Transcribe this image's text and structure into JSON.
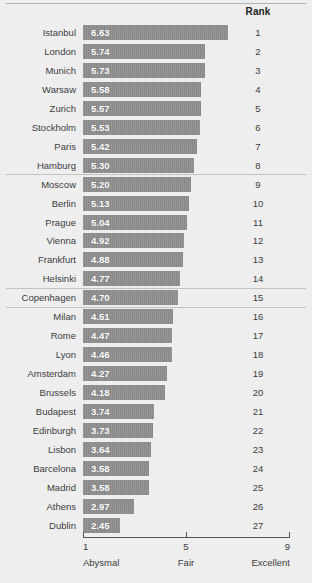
{
  "chart_data": {
    "type": "bar",
    "title": "",
    "subtitle": "",
    "orientation": "horizontal",
    "xlabel": "",
    "ylabel": "",
    "xlim": [
      1,
      9
    ],
    "grid": false,
    "legend": null,
    "categories": [
      "Istanbul",
      "London",
      "Munich",
      "Warsaw",
      "Zurich",
      "Stockholm",
      "Paris",
      "Hamburg",
      "Moscow",
      "Berlin",
      "Prague",
      "Vienna",
      "Frankfurt",
      "Helsinki",
      "Copenhagen",
      "Milan",
      "Rome",
      "Lyon",
      "Amsterdam",
      "Brussels",
      "Budapest",
      "Edinburgh",
      "Lisbon",
      "Barcelona",
      "Madrid",
      "Athens",
      "Dublin"
    ],
    "values": [
      6.63,
      5.74,
      5.73,
      5.58,
      5.57,
      5.53,
      5.42,
      5.3,
      5.2,
      5.13,
      5.04,
      4.92,
      4.88,
      4.77,
      4.7,
      4.51,
      4.47,
      4.46,
      4.27,
      4.18,
      3.74,
      3.73,
      3.64,
      3.58,
      3.58,
      2.97,
      2.45
    ],
    "ranks": [
      1,
      2,
      3,
      4,
      5,
      6,
      7,
      8,
      9,
      10,
      11,
      12,
      13,
      14,
      15,
      16,
      17,
      18,
      19,
      20,
      21,
      22,
      23,
      24,
      25,
      26,
      27
    ],
    "bar_value_labels": [
      "6.63",
      "5.74",
      "5.73",
      "5.58",
      "5.57",
      "5.53",
      "5.42",
      "5.30",
      "5.20",
      "5.13",
      "5.04",
      "4.92",
      "4.88",
      "4.77",
      "4.70",
      "4.51",
      "4.47",
      "4.46",
      "4.27",
      "4.18",
      "3.74",
      "3.73",
      "3.64",
      "3.58",
      "3.58",
      "2.97",
      "2.45"
    ],
    "group_separators_after_rank": [
      8,
      14,
      15
    ],
    "axis_ticks": [
      {
        "value": 1,
        "number_label": "1",
        "word_label": "Abysmal"
      },
      {
        "value": 5,
        "number_label": "5",
        "word_label": "Fair"
      },
      {
        "value": 9,
        "number_label": "9",
        "word_label": "Excellent"
      }
    ],
    "colors": {
      "bar": "#8d8d8d",
      "background": "#eeeeee",
      "bar_value_text": "#ffffff",
      "label_text": "#3c3c3c",
      "axis": "#555555",
      "rule": "#b3b3b3"
    }
  },
  "header": {
    "rank_column_label": "Rank"
  }
}
